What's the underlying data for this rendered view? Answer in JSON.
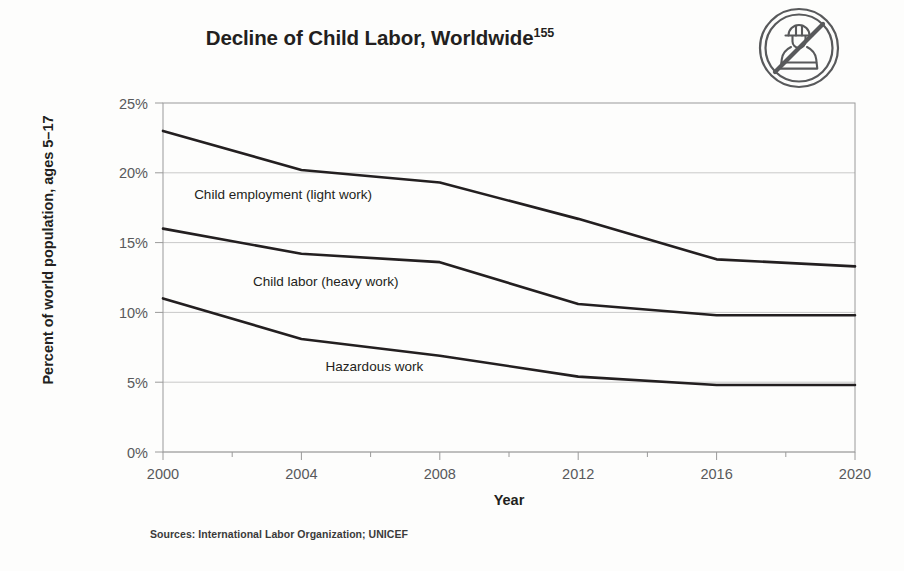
{
  "figure": {
    "title_main": "Decline of Child Labor, Worldwide",
    "title_superscript": "155",
    "source_note": "Sources: International Labor Organization; UNICEF",
    "icon_name": "no-child-labor-icon",
    "background_color": "#fdfdfc",
    "line_color": "#231f20",
    "grid_color": "#c9c9c9",
    "axis_color": "#9a9a9a",
    "tick_text_color": "#58595b"
  },
  "chart_data": {
    "type": "line",
    "title": "Decline of Child Labor, Worldwide",
    "xlabel": "Year",
    "ylabel": "Percent of world population, ages 5–17",
    "x": [
      2000,
      2004,
      2008,
      2012,
      2016,
      2020
    ],
    "xlim": [
      2000,
      2020
    ],
    "ylim": [
      0,
      25
    ],
    "xticks": [
      2000,
      2004,
      2008,
      2012,
      2016,
      2020
    ],
    "xtick_labels": [
      "2000",
      "2004",
      "2008",
      "2012",
      "2016",
      "2020"
    ],
    "x_minor_tick_interval": 2,
    "yticks": [
      0,
      5,
      10,
      15,
      20,
      25
    ],
    "ytick_labels": [
      "0%",
      "5%",
      "10%",
      "15%",
      "20%",
      "25%"
    ],
    "grid": "horizontal",
    "legend": "inline-labels",
    "series": [
      {
        "name": "Child employment (light work)",
        "label": "Child employment (light work)",
        "values": [
          23.0,
          20.2,
          19.3,
          16.7,
          13.8,
          13.3
        ]
      },
      {
        "name": "Child labor (heavy work)",
        "label": "Child labor (heavy work)",
        "values": [
          16.0,
          14.2,
          13.6,
          10.6,
          9.8,
          9.8
        ]
      },
      {
        "name": "Hazardous work",
        "label": "Hazardous work",
        "values": [
          11.0,
          8.1,
          6.9,
          5.4,
          4.8,
          4.8
        ]
      }
    ],
    "annotations": [
      {
        "text": "Child employment (light work)",
        "x": 2000.9,
        "y": 18.1
      },
      {
        "text": "Child labor (heavy work)",
        "x": 2002.6,
        "y": 11.9
      },
      {
        "text": "Hazardous work",
        "x": 2004.7,
        "y": 5.8
      }
    ]
  }
}
